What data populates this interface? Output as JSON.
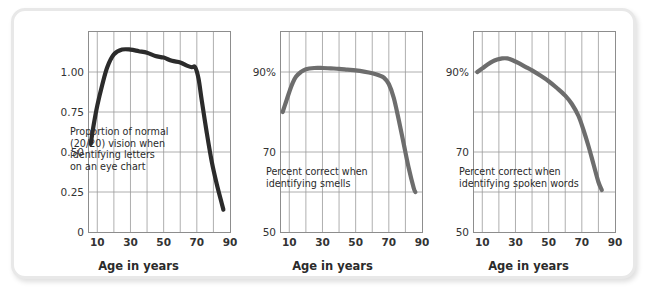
{
  "figure": {
    "background": "#ffffff",
    "frame_border_color": "#e8e8e8",
    "grid_color": "#9a9a9a",
    "axis_color": "#8d8d8d"
  },
  "chart_data": [
    {
      "type": "line",
      "panel_index": 0,
      "title": "",
      "annotation": "Proportion of normal\n(20/20) vision when\nidentifying letters\non an eye chart",
      "xlabel": "Age in years",
      "ylabel": "",
      "line_color": "#2b2b2b",
      "line_width": 4.2,
      "grid": true,
      "xlim": [
        5,
        90
      ],
      "ylim": [
        0,
        1.25
      ],
      "xticks": [
        10,
        30,
        50,
        70,
        90
      ],
      "xtick_labels": [
        "10",
        "30",
        "50",
        "70",
        "90"
      ],
      "xgrid_values": [
        10,
        20,
        30,
        40,
        50,
        60,
        70,
        80
      ],
      "yticks": [
        0,
        0.25,
        0.5,
        0.75,
        1.0
      ],
      "ytick_labels": [
        "0",
        "0.25",
        "0.50",
        "0.75",
        "1.00"
      ],
      "ygrid_values": [
        0.25,
        0.5,
        0.75,
        1.0
      ],
      "x": [
        6,
        8,
        10,
        13,
        16,
        20,
        25,
        30,
        35,
        40,
        45,
        50,
        55,
        60,
        64,
        67,
        69,
        71,
        73,
        76,
        79,
        82,
        85,
        86
      ],
      "y": [
        0.55,
        0.68,
        0.79,
        0.92,
        1.03,
        1.11,
        1.14,
        1.14,
        1.13,
        1.12,
        1.1,
        1.09,
        1.07,
        1.06,
        1.04,
        1.03,
        1.03,
        0.96,
        0.82,
        0.62,
        0.44,
        0.3,
        0.18,
        0.14
      ]
    },
    {
      "type": "line",
      "panel_index": 1,
      "title": "",
      "annotation": "Percent correct when\nidentifying smells",
      "xlabel": "Age in years",
      "ylabel": "",
      "line_color": "#6d6d6d",
      "line_width": 4.2,
      "grid": true,
      "xlim": [
        5,
        90
      ],
      "ylim": [
        50,
        100
      ],
      "xticks": [
        10,
        30,
        50,
        70,
        90
      ],
      "xtick_labels": [
        "10",
        "30",
        "50",
        "70",
        "90"
      ],
      "xgrid_values": [
        10,
        20,
        30,
        40,
        50,
        60,
        70,
        80
      ],
      "yticks": [
        50,
        70,
        90
      ],
      "ytick_labels": [
        "50",
        "70",
        "90%"
      ],
      "ygrid_values": [
        60,
        70,
        80,
        90
      ],
      "x": [
        6,
        8,
        10,
        12,
        14,
        17,
        20,
        25,
        30,
        35,
        40,
        45,
        50,
        55,
        60,
        64,
        67,
        70,
        73,
        76,
        79,
        82,
        85,
        86
      ],
      "y": [
        80.0,
        82.5,
        85.0,
        87.2,
        88.8,
        90.0,
        90.7,
        91.0,
        91.0,
        90.9,
        90.8,
        90.6,
        90.4,
        90.1,
        89.7,
        89.2,
        88.6,
        87.0,
        83.5,
        78.0,
        72.0,
        66.0,
        61.0,
        60.0
      ]
    },
    {
      "type": "line",
      "panel_index": 2,
      "title": "",
      "annotation": "Percent correct when\nidentifying spoken words",
      "xlabel": "Age in years",
      "ylabel": "",
      "line_color": "#6d6d6d",
      "line_width": 4.2,
      "grid": true,
      "xlim": [
        5,
        90
      ],
      "ylim": [
        50,
        100
      ],
      "xticks": [
        10,
        30,
        50,
        70,
        90
      ],
      "xtick_labels": [
        "10",
        "30",
        "50",
        "70",
        "90"
      ],
      "xgrid_values": [
        10,
        20,
        30,
        40,
        50,
        60,
        70,
        80
      ],
      "yticks": [
        50,
        70,
        90
      ],
      "ytick_labels": [
        "50",
        "70",
        "90%"
      ],
      "ygrid_values": [
        60,
        70,
        80,
        90
      ],
      "x": [
        7,
        10,
        13,
        16,
        19,
        22,
        25,
        28,
        32,
        36,
        40,
        45,
        50,
        55,
        60,
        64,
        68,
        71,
        74,
        77,
        80,
        82
      ],
      "y": [
        90.0,
        90.9,
        91.8,
        92.6,
        93.1,
        93.4,
        93.4,
        93.0,
        92.2,
        91.3,
        90.4,
        89.1,
        87.7,
        86.0,
        84.1,
        82.0,
        79.0,
        75.5,
        71.5,
        67.0,
        62.5,
        60.5
      ]
    }
  ]
}
